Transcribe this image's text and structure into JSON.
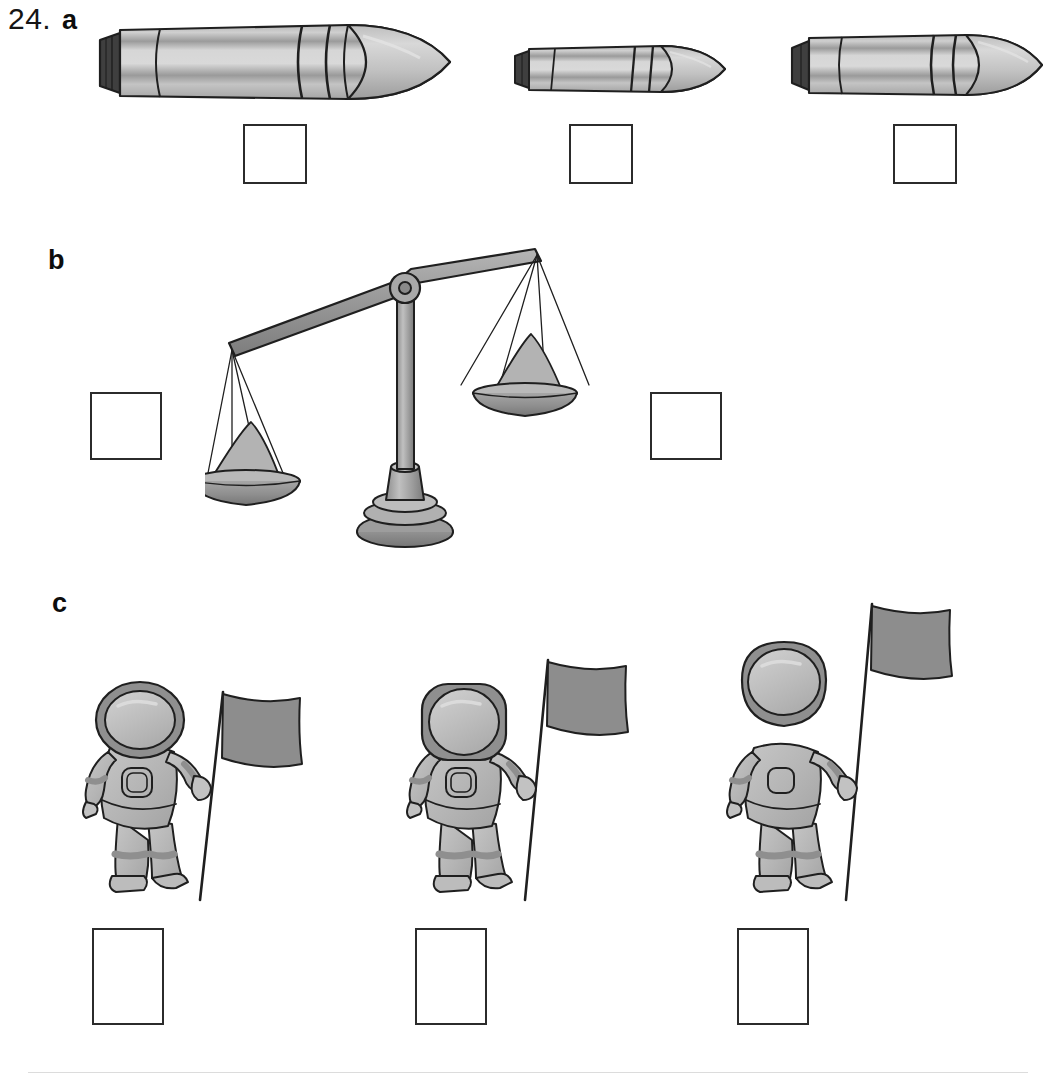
{
  "worksheet": {
    "question_number": "24.",
    "parts": [
      {
        "id": "a",
        "label": "a",
        "topic": "rockets"
      },
      {
        "id": "b",
        "label": "b",
        "topic": "balance-scale"
      },
      {
        "id": "c",
        "label": "c",
        "topic": "astronauts-with-flags"
      }
    ]
  },
  "part_a": {
    "label": "a",
    "rockets": [
      {
        "name": "rocket-large",
        "size": "large",
        "answer_value": ""
      },
      {
        "name": "rocket-small",
        "size": "small",
        "answer_value": ""
      },
      {
        "name": "rocket-medium",
        "size": "medium",
        "answer_value": ""
      }
    ],
    "answer_boxes": [
      {
        "name": "answer-box-a1",
        "value": ""
      },
      {
        "name": "answer-box-a2",
        "value": ""
      },
      {
        "name": "answer-box-a3",
        "value": ""
      }
    ]
  },
  "part_b": {
    "label": "b",
    "scale": {
      "name": "balance-scale",
      "tipped_side": "left",
      "left_pan": {
        "name": "left-pan",
        "content": "pile-of-sand",
        "relative_amount": "more",
        "position": "down"
      },
      "right_pan": {
        "name": "right-pan",
        "content": "pile-of-sand",
        "relative_amount": "less",
        "position": "up"
      }
    },
    "answer_boxes": [
      {
        "name": "answer-box-b-left",
        "value": ""
      },
      {
        "name": "answer-box-b-right",
        "value": ""
      }
    ]
  },
  "part_c": {
    "label": "c",
    "astronauts": [
      {
        "name": "astronaut-flag-short",
        "flag_height": "short",
        "answer_value": ""
      },
      {
        "name": "astronaut-flag-medium",
        "flag_height": "medium",
        "answer_value": ""
      },
      {
        "name": "astronaut-flag-tall",
        "flag_height": "tall",
        "answer_value": ""
      }
    ],
    "answer_boxes": [
      {
        "name": "answer-box-c1",
        "value": ""
      },
      {
        "name": "answer-box-c2",
        "value": ""
      },
      {
        "name": "answer-box-c3",
        "value": ""
      }
    ]
  },
  "colors": {
    "ink": "#2b2b2b",
    "paper": "#ffffff",
    "light_gray": "#c9c9c9",
    "mid_gray": "#a8a8a8",
    "dark_gray": "#8a8a8a",
    "darker_gray": "#6e6e6e",
    "nozzle": "#3f3f3f",
    "flag_gray": "#8d8d8d"
  }
}
